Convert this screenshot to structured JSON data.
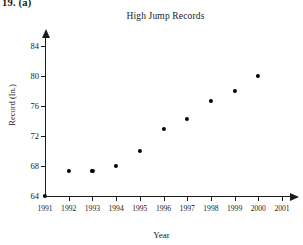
{
  "problem_number": "19. (a)",
  "axis_titles": {
    "x": "Year",
    "y": "Record (In.)"
  },
  "chart_data": {
    "type": "scatter",
    "title": "High Jump Records",
    "xlabel": "Year",
    "ylabel": "Record (In.)",
    "x": [
      1991,
      1992,
      1993,
      1994,
      1995,
      1996,
      1997,
      1998,
      1999,
      2000
    ],
    "values": [
      64,
      67.3,
      67.3,
      68,
      70,
      73,
      74.3,
      76.7,
      78,
      80
    ],
    "points": [
      {
        "x": 1991,
        "y": 64
      },
      {
        "x": 1992,
        "y": 67.3
      },
      {
        "x": 1993,
        "y": 67.3
      },
      {
        "x": 1994,
        "y": 68
      },
      {
        "x": 1995,
        "y": 70
      },
      {
        "x": 1996,
        "y": 73
      },
      {
        "x": 1997,
        "y": 74.3
      },
      {
        "x": 1998,
        "y": 76.7
      },
      {
        "x": 1999,
        "y": 78
      },
      {
        "x": 2000,
        "y": 80
      }
    ],
    "xlim": [
      1991,
      2001
    ],
    "ylim": [
      64,
      86
    ],
    "xticks": [
      1991,
      1992,
      1993,
      1994,
      1995,
      1996,
      1997,
      1998,
      1999,
      2000,
      2001
    ],
    "xtick_labels": [
      "1991",
      "1992",
      "1993",
      "1994",
      "1995",
      "1996",
      "1997",
      "1998",
      "1999",
      "2000",
      "2001"
    ],
    "yticks": [
      64,
      68,
      72,
      76,
      80,
      84
    ],
    "ytick_labels": [
      "64",
      "68",
      "72",
      "76",
      "80",
      "84"
    ],
    "grid": false,
    "legend": null,
    "marker": "filled-circle",
    "marker_color": "#000000",
    "axis_color": "#1a1a1a"
  }
}
